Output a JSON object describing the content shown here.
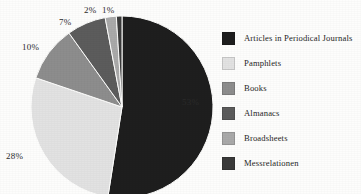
{
  "chart_data": {
    "type": "pie",
    "title": "",
    "subtitle": "",
    "xlabel": "",
    "ylabel": "",
    "legend_position": "right",
    "grid": false,
    "start_angle_deg": 0,
    "direction": "clockwise",
    "categories": [
      "Articles in Periodical Journals",
      "Pamphlets",
      "Books",
      "Almanacs",
      "Broadsheets",
      "Messrelationen"
    ],
    "values": [
      53,
      28,
      10,
      7,
      2,
      1
    ],
    "value_labels": [
      "53%",
      "28%",
      "10%",
      "7%",
      "2%",
      "1%"
    ],
    "colors": [
      "#1e1e1e",
      "#e2e2e2",
      "#8d8d8d",
      "#5c5c5c",
      "#a9a9a9",
      "#3a3a3a"
    ],
    "slices": [
      {
        "label": "Articles in Periodical Journals",
        "value": 53,
        "display": "53%",
        "color": "#1e1e1e"
      },
      {
        "label": "Pamphlets",
        "value": 28,
        "display": "28%",
        "color": "#e2e2e2"
      },
      {
        "label": "Books",
        "value": 10,
        "display": "10%",
        "color": "#8d8d8d"
      },
      {
        "label": "Almanacs",
        "value": 7,
        "display": "7%",
        "color": "#5c5c5c"
      },
      {
        "label": "Broadsheets",
        "value": 2,
        "display": "2%",
        "color": "#a9a9a9"
      },
      {
        "label": "Messrelationen",
        "value": 1,
        "display": "1%",
        "color": "#3a3a3a"
      }
    ]
  },
  "legend": {
    "items": [
      {
        "label": "Articles in Periodical Journals",
        "color": "#1e1e1e"
      },
      {
        "label": "Pamphlets",
        "color": "#e2e2e2"
      },
      {
        "label": "Books",
        "color": "#8d8d8d"
      },
      {
        "label": "Almanacs",
        "color": "#5c5c5c"
      },
      {
        "label": "Broadsheets",
        "color": "#a9a9a9"
      },
      {
        "label": "Messrelationen",
        "color": "#3a3a3a"
      }
    ]
  },
  "labels": {
    "p53": "53%",
    "p28": "28%",
    "p10": "10%",
    "p7": "7%",
    "p2": "2%",
    "p1": "1%"
  },
  "style": {
    "background": "#fdfdfc",
    "text_color": "#262626"
  }
}
